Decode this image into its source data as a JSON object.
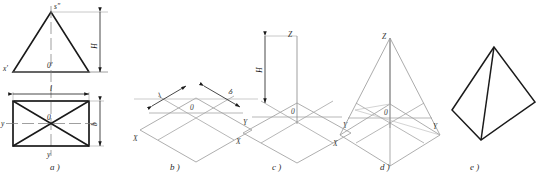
{
  "figure": {
    "panel_count": 5,
    "stroke_heavy": "#1a1a1a",
    "stroke_light": "#8f8f8f",
    "stroke_center": "#777777",
    "background": "#ffffff"
  },
  "captions": [
    {
      "id": "a",
      "text": "a )",
      "x": 50,
      "y": 166
    },
    {
      "id": "b",
      "text": "b )",
      "x": 170,
      "y": 166
    },
    {
      "id": "c",
      "text": "c )",
      "x": 272,
      "y": 166
    },
    {
      "id": "d",
      "text": "d )",
      "x": 380,
      "y": 166
    },
    {
      "id": "e",
      "text": "e )",
      "x": 470,
      "y": 166
    }
  ],
  "panel_a": {
    "name": "orthographic-views",
    "description": "Front view triangle above top view rectangle with diagonals",
    "labels": {
      "apex_front": "s\"",
      "origin_front": "0'",
      "axis_x_front": "x'",
      "origin_top": "0",
      "axis_y_top": "y",
      "axis_center_bottom": "y",
      "dim_height": "H",
      "dim_length": "l",
      "dim_width": "b"
    }
  },
  "panel_b": {
    "name": "isometric-base-outline",
    "description": "Isometric parallelogram base with axonometric axes and plan dimensions",
    "labels": {
      "origin": "0",
      "axis_x": "X",
      "axis_y": "Y",
      "dim_length": "l",
      "dim_width": "b"
    }
  },
  "panel_c": {
    "name": "base-with-vertical-axis",
    "description": "Base parallelogram plus vertical Z axis carrying height H",
    "labels": {
      "origin": "0",
      "axis_x": "X",
      "axis_y": "Y",
      "axis_z": "Z",
      "dim_height": "H"
    }
  },
  "panel_d": {
    "name": "pyramid-wireframe",
    "description": "Apex joined to the four base corners, construction lines retained",
    "labels": {
      "origin": "0",
      "axis_x": "X",
      "axis_y": "Y",
      "apex_z": "Z"
    }
  },
  "panel_e": {
    "name": "finished-pyramid",
    "description": "Completed isometric pyramid with hidden lines removed",
    "labels": {}
  }
}
